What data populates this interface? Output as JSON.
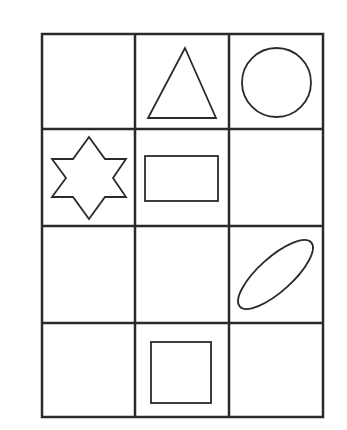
{
  "diagram": {
    "type": "shape-grid",
    "rows": 4,
    "columns": 3,
    "stroke_color": "#2a2a2a",
    "background": "#ffffff",
    "grid": {
      "x": [
        42,
        135,
        229,
        323
      ],
      "y": [
        34,
        129,
        226,
        323,
        417
      ]
    },
    "cells": [
      {
        "row": 0,
        "col": 0,
        "shape": "empty"
      },
      {
        "row": 0,
        "col": 1,
        "shape": "triangle"
      },
      {
        "row": 0,
        "col": 2,
        "shape": "circle"
      },
      {
        "row": 1,
        "col": 0,
        "shape": "six-pointed-star"
      },
      {
        "row": 1,
        "col": 1,
        "shape": "rectangle"
      },
      {
        "row": 1,
        "col": 2,
        "shape": "empty"
      },
      {
        "row": 2,
        "col": 0,
        "shape": "empty"
      },
      {
        "row": 2,
        "col": 1,
        "shape": "empty"
      },
      {
        "row": 2,
        "col": 2,
        "shape": "tilted-ellipse"
      },
      {
        "row": 3,
        "col": 0,
        "shape": "empty"
      },
      {
        "row": 3,
        "col": 1,
        "shape": "square"
      },
      {
        "row": 3,
        "col": 2,
        "shape": "empty"
      }
    ]
  }
}
